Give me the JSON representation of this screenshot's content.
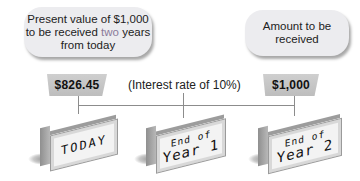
{
  "callouts": {
    "present_value": {
      "line1": "Present value of $1,000",
      "line2_pre": "to be received ",
      "line2_accent": "two",
      "line2_post": " years",
      "line3": "from today"
    },
    "amount": {
      "line1": "Amount to be",
      "line2": "received"
    }
  },
  "values": {
    "present": "$826.45",
    "future": "$1,000"
  },
  "interest_note": "(Interest rate of 10%)",
  "timeline": [
    {
      "label": "TODAY"
    },
    {
      "label_small": "End of",
      "label_big": "Year 1"
    },
    {
      "label_small": "End of",
      "label_big": "Year 2"
    }
  ],
  "colors": {
    "accent_text": "#8a7a9a",
    "callout_bg": "#ececef",
    "tag_bg": "#c4c4c4"
  }
}
